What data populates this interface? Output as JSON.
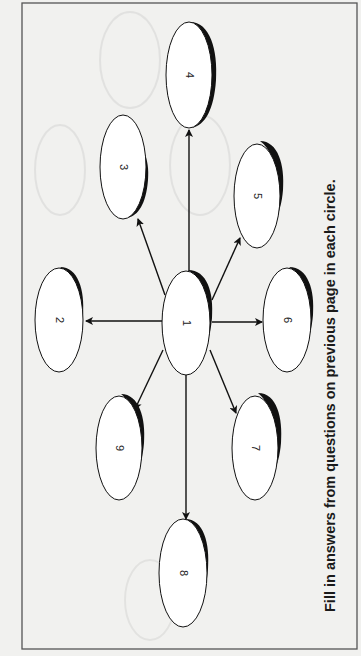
{
  "instruction": "Fill in answers from questions on previous page in each circle.",
  "center_node": {
    "id": "1",
    "label": "1"
  },
  "nodes": [
    {
      "id": "2",
      "label": "2"
    },
    {
      "id": "3",
      "label": "3"
    },
    {
      "id": "4",
      "label": "4"
    },
    {
      "id": "5",
      "label": "5"
    },
    {
      "id": "6",
      "label": "6"
    },
    {
      "id": "7",
      "label": "7"
    },
    {
      "id": "8",
      "label": "8"
    },
    {
      "id": "9",
      "label": "9"
    }
  ],
  "edges": [
    {
      "from": "1",
      "to": "2"
    },
    {
      "from": "1",
      "to": "3"
    },
    {
      "from": "1",
      "to": "4"
    },
    {
      "from": "1",
      "to": "5"
    },
    {
      "from": "1",
      "to": "6"
    },
    {
      "from": "1",
      "to": "7"
    },
    {
      "from": "1",
      "to": "8"
    },
    {
      "from": "1",
      "to": "9"
    }
  ],
  "colors": {
    "paper": "#f1f1ef",
    "ink": "#111111",
    "frame": "#555555"
  }
}
